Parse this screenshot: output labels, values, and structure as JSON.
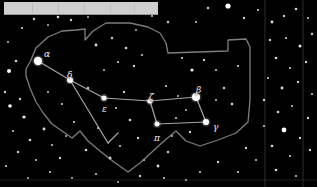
{
  "chart_data": {
    "type": "scatter",
    "xlabel": "",
    "ylabel": "",
    "xlim": [
      0,
      317
    ],
    "ylim": [
      0,
      187
    ],
    "grid": true,
    "legend": "none",
    "background_color": "#000000",
    "star_color": "#ffffff",
    "line_color": "#b9b9b9",
    "boundary_color": "#9e9e9e",
    "label_color": "#f2f2f2",
    "grid_color": "#4a4a4a",
    "labels": [
      {
        "text": "α",
        "name": "alpha",
        "x": 44,
        "y": 50
      },
      {
        "text": "δ",
        "name": "delta",
        "x": 67,
        "y": 71
      },
      {
        "text": "ε",
        "name": "epsilon",
        "x": 102,
        "y": 105
      },
      {
        "text": "ζ",
        "name": "zeta",
        "x": 149,
        "y": 93
      },
      {
        "text": "β",
        "name": "beta",
        "x": 196,
        "y": 86
      },
      {
        "text": "γ",
        "name": "gamma",
        "x": 213,
        "y": 123
      },
      {
        "text": "π",
        "name": "pi",
        "x": 154,
        "y": 134
      }
    ],
    "named_stars": [
      {
        "name": "alpha",
        "x": 38,
        "y": 61,
        "r": 4.2,
        "mag": 2.1
      },
      {
        "name": "delta",
        "x": 70,
        "y": 80,
        "r": 3.0,
        "mag": 3.3
      },
      {
        "name": "epsilon",
        "x": 104,
        "y": 98,
        "r": 2.6,
        "mag": 4.1
      },
      {
        "name": "zeta",
        "x": 150,
        "y": 101,
        "r": 2.6,
        "mag": 4.2
      },
      {
        "name": "beta",
        "x": 196,
        "y": 97,
        "r": 4.0,
        "mag": 2.4
      },
      {
        "name": "gamma",
        "x": 206,
        "y": 122,
        "r": 3.1,
        "mag": 3.4
      },
      {
        "name": "pi",
        "x": 157,
        "y": 124,
        "r": 2.5,
        "mag": 4.5
      }
    ],
    "constellation_lines": [
      [
        [
          38,
          61
        ],
        [
          70,
          80
        ]
      ],
      [
        [
          70,
          80
        ],
        [
          104,
          98
        ]
      ],
      [
        [
          104,
          98
        ],
        [
          150,
          101
        ]
      ],
      [
        [
          150,
          101
        ],
        [
          157,
          124
        ]
      ],
      [
        [
          150,
          101
        ],
        [
          196,
          97
        ]
      ],
      [
        [
          196,
          97
        ],
        [
          206,
          122
        ]
      ],
      [
        [
          206,
          122
        ],
        [
          157,
          124
        ]
      ],
      [
        [
          70,
          80
        ],
        [
          108,
          143
        ]
      ],
      [
        [
          108,
          143
        ],
        [
          118,
          133
        ]
      ]
    ],
    "constellation_boundary": [
      [
        26,
        69
      ],
      [
        30,
        62
      ],
      [
        36,
        48
      ],
      [
        48,
        37
      ],
      [
        62,
        31
      ],
      [
        76,
        30
      ],
      [
        85,
        29
      ],
      [
        85,
        40
      ],
      [
        93,
        31
      ],
      [
        106,
        23
      ],
      [
        130,
        23
      ],
      [
        148,
        27
      ],
      [
        160,
        33
      ],
      [
        166,
        43
      ],
      [
        168,
        53
      ],
      [
        228,
        51
      ],
      [
        228,
        40
      ],
      [
        246,
        39
      ],
      [
        250,
        47
      ],
      [
        250,
        100
      ],
      [
        248,
        122
      ],
      [
        236,
        133
      ],
      [
        218,
        140
      ],
      [
        200,
        146
      ],
      [
        186,
        141
      ],
      [
        176,
        131
      ],
      [
        164,
        141
      ],
      [
        152,
        152
      ],
      [
        140,
        163
      ],
      [
        128,
        172
      ],
      [
        114,
        162
      ],
      [
        100,
        151
      ],
      [
        88,
        141
      ],
      [
        80,
        131
      ],
      [
        72,
        138
      ],
      [
        62,
        131
      ],
      [
        52,
        124
      ],
      [
        44,
        114
      ],
      [
        36,
        102
      ],
      [
        30,
        88
      ],
      [
        26,
        76
      ]
    ],
    "grid_lines_vertical": [
      265,
      303
    ],
    "grid_lines_horizontal": [
      180
    ],
    "background_stars": [
      {
        "x": 9,
        "y": 71,
        "r": 2.0
      },
      {
        "x": 16,
        "y": 61,
        "r": 1.3
      },
      {
        "x": 5,
        "y": 92,
        "r": 1.2
      },
      {
        "x": 10,
        "y": 106,
        "r": 1.8
      },
      {
        "x": 20,
        "y": 99,
        "r": 1.2
      },
      {
        "x": 24,
        "y": 117,
        "r": 1.6
      },
      {
        "x": 13,
        "y": 131,
        "r": 1.1
      },
      {
        "x": 30,
        "y": 140,
        "r": 1.3
      },
      {
        "x": 18,
        "y": 152,
        "r": 1.2
      },
      {
        "x": 36,
        "y": 160,
        "r": 1.1
      },
      {
        "x": 8,
        "y": 42,
        "r": 1.0
      },
      {
        "x": 22,
        "y": 28,
        "r": 1.1
      },
      {
        "x": 34,
        "y": 19,
        "r": 1.2
      },
      {
        "x": 48,
        "y": 25,
        "r": 1.0
      },
      {
        "x": 58,
        "y": 17,
        "r": 1.3
      },
      {
        "x": 44,
        "y": 129,
        "r": 1.4
      },
      {
        "x": 52,
        "y": 145,
        "r": 1.1
      },
      {
        "x": 60,
        "y": 158,
        "r": 1.2
      },
      {
        "x": 66,
        "y": 136,
        "r": 1.0
      },
      {
        "x": 74,
        "y": 122,
        "r": 1.1
      },
      {
        "x": 71,
        "y": 20,
        "r": 1.2
      },
      {
        "x": 88,
        "y": 17,
        "r": 1.0
      },
      {
        "x": 96,
        "y": 45,
        "r": 1.4
      },
      {
        "x": 112,
        "y": 38,
        "r": 1.2
      },
      {
        "x": 126,
        "y": 48,
        "r": 1.3
      },
      {
        "x": 118,
        "y": 62,
        "r": 1.1
      },
      {
        "x": 104,
        "y": 70,
        "r": 1.0
      },
      {
        "x": 134,
        "y": 66,
        "r": 1.2
      },
      {
        "x": 142,
        "y": 55,
        "r": 1.1
      },
      {
        "x": 88,
        "y": 88,
        "r": 1.2
      },
      {
        "x": 98,
        "y": 128,
        "r": 1.1
      },
      {
        "x": 86,
        "y": 150,
        "r": 1.3
      },
      {
        "x": 110,
        "y": 158,
        "r": 1.5
      },
      {
        "x": 120,
        "y": 146,
        "r": 1.1
      },
      {
        "x": 130,
        "y": 120,
        "r": 1.3
      },
      {
        "x": 138,
        "y": 138,
        "r": 1.2
      },
      {
        "x": 144,
        "y": 160,
        "r": 1.1
      },
      {
        "x": 158,
        "y": 166,
        "r": 1.4
      },
      {
        "x": 168,
        "y": 152,
        "r": 1.2
      },
      {
        "x": 176,
        "y": 118,
        "r": 1.1
      },
      {
        "x": 186,
        "y": 110,
        "r": 1.0
      },
      {
        "x": 192,
        "y": 70,
        "r": 1.6
      },
      {
        "x": 182,
        "y": 58,
        "r": 1.1
      },
      {
        "x": 204,
        "y": 60,
        "r": 1.2
      },
      {
        "x": 216,
        "y": 70,
        "r": 1.1
      },
      {
        "x": 224,
        "y": 88,
        "r": 1.2
      },
      {
        "x": 232,
        "y": 104,
        "r": 1.3
      },
      {
        "x": 216,
        "y": 100,
        "r": 1.0
      },
      {
        "x": 238,
        "y": 66,
        "r": 1.1
      },
      {
        "x": 208,
        "y": 8,
        "r": 1.2
      },
      {
        "x": 228,
        "y": 6,
        "r": 2.6
      },
      {
        "x": 196,
        "y": 22,
        "r": 1.1
      },
      {
        "x": 244,
        "y": 18,
        "r": 1.2
      },
      {
        "x": 258,
        "y": 10,
        "r": 1.1
      },
      {
        "x": 272,
        "y": 22,
        "r": 1.4
      },
      {
        "x": 284,
        "y": 16,
        "r": 1.2
      },
      {
        "x": 296,
        "y": 9,
        "r": 1.3
      },
      {
        "x": 308,
        "y": 18,
        "r": 1.1
      },
      {
        "x": 270,
        "y": 40,
        "r": 1.2
      },
      {
        "x": 286,
        "y": 38,
        "r": 1.1
      },
      {
        "x": 300,
        "y": 46,
        "r": 1.5
      },
      {
        "x": 312,
        "y": 34,
        "r": 1.2
      },
      {
        "x": 276,
        "y": 58,
        "r": 1.3
      },
      {
        "x": 290,
        "y": 68,
        "r": 1.1
      },
      {
        "x": 306,
        "y": 62,
        "r": 1.2
      },
      {
        "x": 268,
        "y": 78,
        "r": 1.1
      },
      {
        "x": 282,
        "y": 88,
        "r": 1.4
      },
      {
        "x": 298,
        "y": 82,
        "r": 1.2
      },
      {
        "x": 312,
        "y": 94,
        "r": 1.1
      },
      {
        "x": 264,
        "y": 100,
        "r": 1.2
      },
      {
        "x": 278,
        "y": 112,
        "r": 1.3
      },
      {
        "x": 292,
        "y": 106,
        "r": 1.1
      },
      {
        "x": 308,
        "y": 118,
        "r": 1.2
      },
      {
        "x": 284,
        "y": 130,
        "r": 2.4
      },
      {
        "x": 264,
        "y": 126,
        "r": 1.1
      },
      {
        "x": 300,
        "y": 138,
        "r": 1.2
      },
      {
        "x": 272,
        "y": 146,
        "r": 1.3
      },
      {
        "x": 290,
        "y": 156,
        "r": 1.1
      },
      {
        "x": 310,
        "y": 150,
        "r": 1.2
      },
      {
        "x": 256,
        "y": 160,
        "r": 1.1
      },
      {
        "x": 276,
        "y": 170,
        "r": 1.3
      },
      {
        "x": 296,
        "y": 176,
        "r": 1.1
      },
      {
        "x": 246,
        "y": 148,
        "r": 1.2
      },
      {
        "x": 238,
        "y": 172,
        "r": 1.1
      },
      {
        "x": 218,
        "y": 162,
        "r": 1.2
      },
      {
        "x": 200,
        "y": 172,
        "r": 1.1
      },
      {
        "x": 186,
        "y": 180,
        "r": 1.0
      },
      {
        "x": 164,
        "y": 178,
        "r": 1.1
      },
      {
        "x": 140,
        "y": 176,
        "r": 1.2
      },
      {
        "x": 118,
        "y": 182,
        "r": 1.0
      },
      {
        "x": 96,
        "y": 174,
        "r": 1.1
      },
      {
        "x": 72,
        "y": 178,
        "r": 1.0
      },
      {
        "x": 50,
        "y": 172,
        "r": 1.1
      },
      {
        "x": 28,
        "y": 178,
        "r": 1.0
      },
      {
        "x": 6,
        "y": 166,
        "r": 1.1
      },
      {
        "x": 168,
        "y": 22,
        "r": 1.2
      },
      {
        "x": 152,
        "y": 16,
        "r": 1.1
      },
      {
        "x": 136,
        "y": 30,
        "r": 1.0
      },
      {
        "x": 62,
        "y": 104,
        "r": 1.1
      },
      {
        "x": 48,
        "y": 92,
        "r": 1.0
      },
      {
        "x": 124,
        "y": 92,
        "r": 1.2
      },
      {
        "x": 116,
        "y": 108,
        "r": 1.1
      },
      {
        "x": 166,
        "y": 86,
        "r": 1.1
      },
      {
        "x": 178,
        "y": 96,
        "r": 1.0
      },
      {
        "x": 190,
        "y": 132,
        "r": 1.2
      },
      {
        "x": 172,
        "y": 136,
        "r": 1.0
      }
    ]
  },
  "top_bar": {
    "present": true,
    "x": 4,
    "y": 2,
    "width": 154,
    "height": 12,
    "color": "#cfcfcf"
  }
}
